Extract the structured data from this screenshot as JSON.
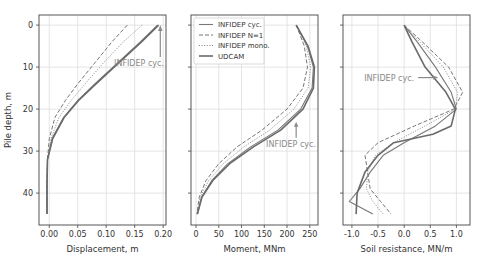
{
  "figure": {
    "ylabel": "Pile depth, m",
    "annotation": "INFIDEP cyc.",
    "legend": [
      "INFIDEP cyc.",
      "INFIDEP N=1",
      "INFIDEP mono.",
      "UDCAM"
    ],
    "colors": {
      "main": "#6e6e6e",
      "grid": "#dddddd",
      "frame": "#444444",
      "annotation": "#8a8a8a"
    }
  },
  "chart_data": [
    {
      "type": "line",
      "title": "",
      "xlabel": "Displacement, m",
      "ylabel": "Pile depth, m",
      "xticks": [
        "0.00",
        "0.05",
        "0.10",
        "0.15",
        "0.20"
      ],
      "yticks": [
        "0",
        "10",
        "20",
        "30",
        "40"
      ],
      "xlim": [
        -0.018,
        0.205
      ],
      "ylim": [
        47.6,
        -2.4
      ],
      "grid": true,
      "annotation": {
        "text": "INFIDEP cyc.",
        "arrow_to": [
          0.195,
          0
        ]
      },
      "series": [
        {
          "name": "INFIDEP cyc.",
          "style": "solid",
          "x": [
            0.19,
            0.16,
            0.12,
            0.08,
            0.05,
            0.025,
            0.005,
            -0.003,
            -0.004,
            -0.004
          ],
          "y": [
            0,
            4,
            9,
            14,
            18,
            22,
            27,
            32,
            38,
            45
          ]
        },
        {
          "name": "INFIDEP N=1",
          "style": "dashed",
          "x": [
            0.137,
            0.11,
            0.08,
            0.05,
            0.028,
            0.01,
            0.0,
            -0.003,
            -0.004,
            -0.004
          ],
          "y": [
            0,
            4,
            9,
            14,
            18,
            22,
            27,
            32,
            38,
            45
          ]
        },
        {
          "name": "INFIDEP mono.",
          "style": "dotted",
          "x": [
            0.163,
            0.13,
            0.095,
            0.063,
            0.038,
            0.017,
            0.003,
            -0.003,
            -0.004,
            -0.004
          ],
          "y": [
            0,
            4,
            9,
            14,
            18,
            22,
            27,
            32,
            38,
            45
          ]
        },
        {
          "name": "UDCAM",
          "style": "solid-thick",
          "x": [
            0.192,
            0.162,
            0.122,
            0.082,
            0.051,
            0.026,
            0.006,
            -0.003,
            -0.004,
            -0.004
          ],
          "y": [
            0,
            4,
            9,
            14,
            18,
            22,
            27,
            32,
            38,
            45
          ]
        }
      ]
    },
    {
      "type": "line",
      "title": "",
      "xlabel": "Moment, MNm",
      "ylabel": "",
      "xticks": [
        "0",
        "50",
        "100",
        "150",
        "200",
        "250"
      ],
      "yticks": [
        "0",
        "10",
        "20",
        "30",
        "40"
      ],
      "xlim": [
        -11,
        268
      ],
      "ylim": [
        47.6,
        -2.4
      ],
      "grid": true,
      "legend_position": "upper left",
      "annotation": {
        "text": "INFIDEP cyc.",
        "arrow_to": [
          220,
          23
        ]
      },
      "series": [
        {
          "name": "INFIDEP cyc.",
          "style": "solid",
          "x": [
            220,
            245,
            258,
            255,
            230,
            180,
            120,
            70,
            35,
            12,
            3
          ],
          "y": [
            0,
            5,
            10,
            15,
            20,
            25,
            29,
            33,
            37,
            41,
            45
          ]
        },
        {
          "name": "INFIDEP N=1",
          "style": "dashed",
          "x": [
            220,
            238,
            245,
            235,
            200,
            145,
            90,
            50,
            22,
            7,
            2
          ],
          "y": [
            0,
            5,
            10,
            15,
            20,
            25,
            29,
            33,
            37,
            41,
            45
          ]
        },
        {
          "name": "INFIDEP mono.",
          "style": "dotted",
          "x": [
            220,
            242,
            252,
            246,
            215,
            162,
            105,
            60,
            28,
            9,
            2
          ],
          "y": [
            0,
            5,
            10,
            15,
            20,
            25,
            29,
            33,
            37,
            41,
            45
          ]
        },
        {
          "name": "UDCAM",
          "style": "solid-thick",
          "x": [
            220,
            246,
            260,
            258,
            235,
            186,
            126,
            74,
            37,
            13,
            3
          ],
          "y": [
            0,
            5,
            10,
            15,
            20,
            25,
            29,
            33,
            37,
            41,
            45
          ]
        }
      ]
    },
    {
      "type": "line",
      "title": "",
      "xlabel": "Soil resistance, MN/m",
      "ylabel": "",
      "xticks": [
        "-1.0",
        "-0.5",
        "0.0",
        "0.5",
        "1.0"
      ],
      "yticks": [
        "0",
        "10",
        "20",
        "30",
        "40"
      ],
      "xlim": [
        -1.17,
        1.26
      ],
      "ylim": [
        47.6,
        -2.4
      ],
      "grid": true,
      "annotation": {
        "text": "INFIDEP cyc.",
        "arrow_to": [
          0.65,
          12.5
        ]
      },
      "series": [
        {
          "name": "INFIDEP cyc.",
          "style": "solid",
          "x": [
            0.0,
            0.25,
            0.6,
            0.9,
            1.0,
            0.6,
            0.0,
            -0.4,
            -0.65,
            -0.85,
            -1.05,
            -0.6
          ],
          "y": [
            0,
            4,
            10,
            16,
            20,
            24,
            28,
            31,
            35,
            39,
            42,
            45
          ]
        },
        {
          "name": "INFIDEP N=1",
          "style": "dashed",
          "x": [
            0.0,
            0.35,
            0.85,
            1.12,
            0.95,
            0.2,
            -0.5,
            -0.75,
            -0.7,
            -0.65,
            -0.45,
            -0.25
          ],
          "y": [
            0,
            4,
            10,
            16,
            20,
            24,
            28,
            31,
            35,
            39,
            42,
            45
          ]
        },
        {
          "name": "INFIDEP mono.",
          "style": "dotted",
          "x": [
            0.0,
            0.3,
            0.75,
            1.02,
            0.98,
            0.4,
            -0.2,
            -0.55,
            -0.7,
            -0.72,
            -0.6,
            -0.4
          ],
          "y": [
            0,
            4,
            10,
            16,
            20,
            24,
            28,
            31,
            35,
            39,
            42,
            45
          ]
        },
        {
          "name": "UDCAM",
          "style": "solid-thick",
          "x": [
            0.0,
            0.15,
            0.4,
            0.8,
            0.98,
            0.9,
            0.55,
            -0.2,
            -0.5,
            -0.75,
            -0.9,
            -0.92
          ],
          "y": [
            0,
            4,
            10,
            16,
            20,
            24,
            26,
            28,
            31,
            35,
            40,
            45
          ]
        }
      ]
    }
  ]
}
